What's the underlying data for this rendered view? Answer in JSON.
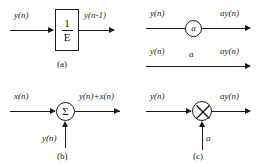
{
  "figure": {
    "ink_color": "#1a1a1a",
    "background_color": "#ffffff"
  },
  "panels": [
    {
      "id": "a",
      "caption": "(a)",
      "description": "unit delay element",
      "input_label": "y(n)",
      "output_label": "y(n-1)",
      "block": {
        "type": "delay-box",
        "numerator": "1",
        "denominator": "E"
      }
    },
    {
      "id": "gain",
      "caption": "",
      "description": "constant multiplier, two equivalent notations",
      "rows": [
        {
          "input_label": "y(n)",
          "operator_label": "a",
          "operator_style": "circle",
          "output_label": "ay(n)"
        },
        {
          "input_label": "y(n)",
          "operator_label": "a",
          "operator_style": "branch-gain",
          "output_label": "ay(n)"
        }
      ]
    },
    {
      "id": "b",
      "caption": "(b)",
      "description": "summing junction",
      "input_label": "x(n)",
      "second_input_label": "y(n)",
      "output_label": "y(n)+x(n)",
      "block": {
        "type": "summer",
        "glyph": "Σ"
      }
    },
    {
      "id": "c",
      "caption": "(c)",
      "description": "multiplier junction",
      "input_label": "y(n)",
      "second_input_label": "a",
      "output_label": "ay(n)",
      "block": {
        "type": "multiplier",
        "glyph": "⊗"
      }
    }
  ]
}
